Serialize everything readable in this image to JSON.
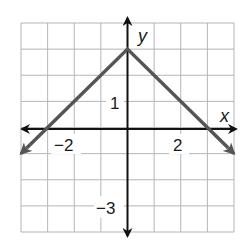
{
  "chart_data": {
    "type": "line",
    "title": "",
    "function": "y = -|x| + 3",
    "xlabel": "x",
    "ylabel": "y",
    "xlim": [
      -4,
      4
    ],
    "ylim": [
      -4,
      4
    ],
    "grid": true,
    "grid_step": 1,
    "tick_labels": {
      "x": [
        {
          "value": -2,
          "label": "−2"
        },
        {
          "value": 2,
          "label": "2"
        }
      ],
      "y": [
        {
          "value": 1,
          "label": "1"
        },
        {
          "value": -3,
          "label": "−3"
        }
      ]
    },
    "series": [
      {
        "name": "graph",
        "color": "#555555",
        "points": [
          [
            -4,
            -1
          ],
          [
            0,
            3
          ],
          [
            4,
            -1
          ]
        ],
        "arrows": [
          "start",
          "end"
        ]
      }
    ]
  },
  "labels": {
    "x_axis": "x",
    "y_axis": "y",
    "x_neg2": "−2",
    "x_pos2": "2",
    "y_pos1": "1",
    "y_neg3": "−3"
  },
  "colors": {
    "grid": "#b5b5b5",
    "axis": "#111111",
    "graph": "#555555"
  }
}
